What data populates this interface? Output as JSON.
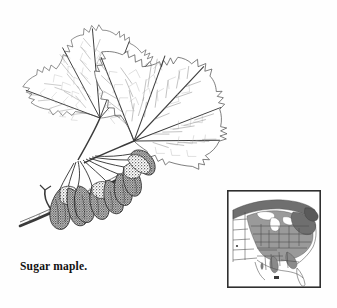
{
  "plate": {
    "width": 337,
    "height": 308,
    "background_color": "#fefefe",
    "medium": "pen-and-ink line drawing",
    "subject_common_name": "Sugar maple",
    "caption": "Sugar maple."
  },
  "illustration": {
    "title": "Sugar maple branch with leaves and samaras",
    "ink_color": "#3a3a3a",
    "vein_color": "#777777",
    "samara_fill": "#4a4a4a",
    "parts": [
      {
        "name": "upper-left-leaf",
        "label": "Sugar maple leaf, upper left",
        "lobes": 5,
        "center_x": 98,
        "center_y": 105,
        "rotation_deg": -14
      },
      {
        "name": "right-leaf",
        "label": "Sugar maple leaf, right",
        "lobes": 5,
        "center_x": 135,
        "center_y": 137,
        "rotation_deg": 34
      },
      {
        "name": "twig",
        "label": "Woody twig with lateral bud",
        "from_x": 22,
        "from_y": 222,
        "to_x": 140,
        "to_y": 160
      },
      {
        "name": "samara-cluster",
        "label": "Cluster of paired winged samaras",
        "count": 9,
        "center_x": 100,
        "center_y": 190
      }
    ]
  },
  "range_map": {
    "title": "Natural range of sugar maple in eastern North America",
    "frame": {
      "x": 227,
      "y": 190,
      "width": 94,
      "height": 98
    },
    "frame_color": "#333333",
    "land_fill": "#ffffff",
    "range_fill": "#9a9a9a",
    "range_fill_dark": "#6f6f6f",
    "boundary_color": "#555555",
    "regions_shaded": [
      "Southern Ontario and Quebec",
      "New England",
      "New York",
      "Pennsylvania",
      "Ohio",
      "Michigan",
      "Wisconsin",
      "Indiana",
      "Illinois",
      "Kentucky",
      "Tennessee",
      "West Virginia",
      "Virginia",
      "Appalachian Highlands"
    ],
    "regions_unshaded": [
      "Florida",
      "Gulf Coastal Plain",
      "Great Plains",
      "Atlantic Coastal Plain"
    ]
  }
}
